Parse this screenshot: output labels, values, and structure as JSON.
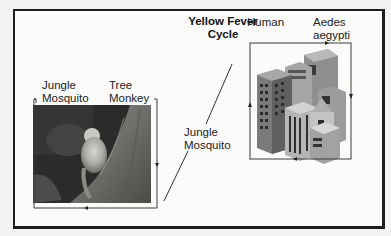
{
  "diagram": {
    "title_line1": "Yellow Fever",
    "title_line2": "Cycle",
    "jungle_cycle": {
      "label_mosquito_line1": "Jungle",
      "label_mosquito_line2": "Mosquito",
      "label_host_line1": "Tree",
      "label_host_line2": "Monkey",
      "image": "tree-monkey-photo"
    },
    "bridge": {
      "label_line1": "Jungle",
      "label_line2": "Mosquito"
    },
    "urban_cycle": {
      "label_host": "Human",
      "label_mosquito_line1": "Aedes",
      "label_mosquito_line2": "aegypti",
      "image": "city-buildings-illustration"
    },
    "colors": {
      "frame": "#1e1e1e",
      "loop_line": "#3a3a3a",
      "background": "#fbfbfa"
    }
  }
}
